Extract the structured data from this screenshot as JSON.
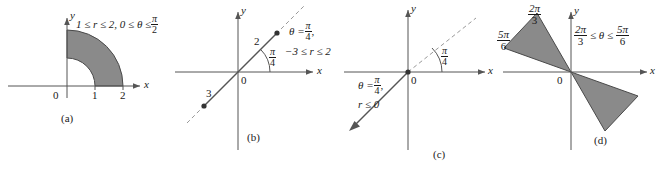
{
  "figure": {
    "background": "#ffffff",
    "ink": "#1a1a1a",
    "shade": "#8a8a8a",
    "panels": [
      {
        "caption": "(a)",
        "axis_x": "x",
        "axis_y": "y",
        "origin_label": "0",
        "ticks": [
          "1",
          "2"
        ],
        "condition_prefix": "1 ≤ r ≤ 2, 0 ≤ θ ≤",
        "condition_frac_num": "π",
        "condition_frac_den": "2"
      },
      {
        "caption": "(b)",
        "axis_x": "x",
        "axis_y": "y",
        "origin_label": "0",
        "seg_label_upper": "2",
        "seg_label_lower": "3",
        "angle_frac_num": "π",
        "angle_frac_den": "4",
        "cond_line1_prefix": "θ =",
        "cond_line1_num": "π",
        "cond_line1_den": "4",
        "cond_line1_suffix": ",",
        "cond_line2": "−3 ≤ r ≤ 2"
      },
      {
        "caption": "(c)",
        "axis_x": "x",
        "axis_y": "y",
        "origin_label": "0",
        "angle_frac_num": "π",
        "angle_frac_den": "4",
        "cond_line1_prefix": "θ =",
        "cond_line1_num": "π",
        "cond_line1_den": "4",
        "cond_line1_suffix": ",",
        "cond_line2": "r ≤ 0"
      },
      {
        "caption": "(d)",
        "axis_x": "x",
        "axis_y": "y",
        "origin_label": "0",
        "ray_label_upper_num": "2π",
        "ray_label_upper_den": "3",
        "ray_label_lower_num": "5π",
        "ray_label_lower_den": "6",
        "cond_num_left": "2π",
        "cond_den_left": "3",
        "cond_mid": "≤ θ ≤",
        "cond_num_right": "5π",
        "cond_den_right": "6"
      }
    ]
  }
}
